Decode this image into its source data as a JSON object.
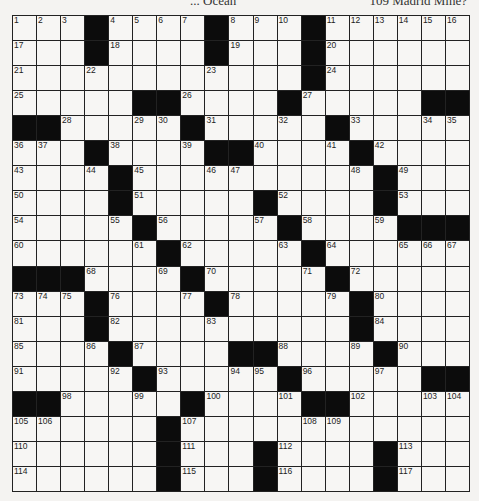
{
  "header": {
    "left_clue_fragment": "... Ocean",
    "right_clue_fragment": "109 Madrid Mine?"
  },
  "grid": {
    "rows": 19,
    "cols": 19,
    "black": [
      [
        3,
        8,
        12
      ],
      [
        3,
        8,
        12
      ],
      [
        12
      ],
      [
        5,
        6,
        11,
        17,
        18
      ],
      [
        0,
        1,
        7,
        13
      ],
      [
        3,
        8,
        9,
        14
      ],
      [
        4,
        15
      ],
      [
        4,
        10,
        15
      ],
      [
        5,
        11,
        16,
        17,
        18
      ],
      [
        6,
        12
      ],
      [
        0,
        1,
        2,
        7,
        13
      ],
      [
        3,
        8,
        14
      ],
      [
        3,
        14
      ],
      [
        4,
        9,
        10,
        15
      ],
      [
        5,
        11,
        17,
        18
      ],
      [
        0,
        1,
        7,
        12,
        13
      ],
      [
        6
      ],
      [
        6,
        10,
        15
      ],
      [
        6,
        10,
        15
      ]
    ],
    "numbers": [
      [
        [
          0,
          1
        ],
        [
          1,
          2
        ],
        [
          2,
          3
        ],
        [
          4,
          4
        ],
        [
          5,
          5
        ],
        [
          6,
          6
        ],
        [
          7,
          7
        ],
        [
          9,
          8
        ],
        [
          10,
          9
        ],
        [
          11,
          10
        ],
        [
          13,
          11
        ],
        [
          14,
          12
        ],
        [
          15,
          13
        ],
        [
          16,
          14
        ],
        [
          17,
          15
        ],
        [
          18,
          16
        ]
      ],
      [
        [
          0,
          17
        ],
        [
          4,
          18
        ],
        [
          9,
          19
        ],
        [
          13,
          20
        ]
      ],
      [
        [
          0,
          21
        ],
        [
          3,
          22
        ],
        [
          8,
          23
        ],
        [
          13,
          24
        ]
      ],
      [
        [
          0,
          25
        ],
        [
          7,
          26
        ],
        [
          12,
          27
        ]
      ],
      [
        [
          2,
          28
        ],
        [
          5,
          29
        ],
        [
          6,
          30
        ],
        [
          8,
          31
        ],
        [
          11,
          32
        ],
        [
          14,
          33
        ],
        [
          17,
          34
        ],
        [
          18,
          35
        ]
      ],
      [
        [
          0,
          36
        ],
        [
          1,
          37
        ],
        [
          4,
          38
        ],
        [
          7,
          39
        ],
        [
          10,
          40
        ],
        [
          13,
          41
        ],
        [
          15,
          42
        ]
      ],
      [
        [
          0,
          43
        ],
        [
          3,
          44
        ],
        [
          5,
          45
        ],
        [
          8,
          46
        ],
        [
          9,
          47
        ],
        [
          14,
          48
        ],
        [
          16,
          49
        ]
      ],
      [
        [
          0,
          50
        ],
        [
          5,
          51
        ],
        [
          11,
          52
        ],
        [
          16,
          53
        ]
      ],
      [
        [
          0,
          54
        ],
        [
          4,
          55
        ],
        [
          6,
          56
        ],
        [
          10,
          57
        ],
        [
          12,
          58
        ],
        [
          15,
          59
        ]
      ],
      [
        [
          0,
          60
        ],
        [
          5,
          61
        ],
        [
          7,
          62
        ],
        [
          11,
          63
        ],
        [
          13,
          64
        ],
        [
          16,
          65
        ],
        [
          17,
          66
        ],
        [
          18,
          67
        ]
      ],
      [
        [
          3,
          68
        ],
        [
          6,
          69
        ],
        [
          8,
          70
        ],
        [
          12,
          71
        ],
        [
          14,
          72
        ]
      ],
      [
        [
          0,
          73
        ],
        [
          1,
          74
        ],
        [
          2,
          75
        ],
        [
          4,
          76
        ],
        [
          7,
          77
        ],
        [
          9,
          78
        ],
        [
          13,
          79
        ],
        [
          15,
          80
        ]
      ],
      [
        [
          0,
          81
        ],
        [
          4,
          82
        ],
        [
          8,
          83
        ],
        [
          15,
          84
        ]
      ],
      [
        [
          0,
          85
        ],
        [
          3,
          86
        ],
        [
          5,
          87
        ],
        [
          11,
          88
        ],
        [
          14,
          89
        ],
        [
          16,
          90
        ]
      ],
      [
        [
          0,
          91
        ],
        [
          4,
          92
        ],
        [
          6,
          93
        ],
        [
          9,
          94
        ],
        [
          10,
          95
        ],
        [
          12,
          96
        ],
        [
          15,
          97
        ]
      ],
      [
        [
          2,
          98
        ],
        [
          5,
          99
        ],
        [
          8,
          100
        ],
        [
          11,
          101
        ],
        [
          14,
          102
        ],
        [
          17,
          103
        ],
        [
          18,
          104
        ]
      ],
      [
        [
          0,
          105
        ],
        [
          1,
          106
        ],
        [
          7,
          107
        ],
        [
          12,
          108
        ],
        [
          13,
          109
        ]
      ],
      [
        [
          0,
          110
        ],
        [
          7,
          111
        ],
        [
          11,
          112
        ],
        [
          16,
          113
        ]
      ],
      [
        [
          0,
          114
        ],
        [
          7,
          115
        ],
        [
          11,
          116
        ],
        [
          16,
          117
        ]
      ]
    ]
  }
}
